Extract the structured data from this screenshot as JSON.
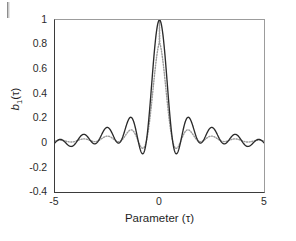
{
  "figure": {
    "axis_labels": {
      "x": "Parameter (τ)",
      "y": "b₁(τ)",
      "y_main": "b",
      "y_sub": "1",
      "y_tail": "(τ)"
    },
    "xticks": [
      "-5",
      "0",
      "5"
    ],
    "yticks": [
      "1",
      "0.8",
      "0.6",
      "0.4",
      "0.2",
      "0",
      "-0.2",
      "-0.4"
    ],
    "colors": {
      "solid_curve": "#2b2b2b",
      "dotted_curve": "#9a9a9a",
      "axis": "#3b3b3b",
      "background": "#ffffff"
    }
  },
  "chart_data": {
    "type": "line",
    "title": "",
    "subtitle": "",
    "xlabel": "Parameter (τ)",
    "ylabel": "b₁(τ)",
    "xlim": [
      -5,
      5
    ],
    "ylim": [
      -0.4,
      1
    ],
    "xticks": [
      -5,
      0,
      5
    ],
    "yticks": [
      -0.4,
      -0.2,
      0,
      0.2,
      0.4,
      0.6,
      0.8,
      1
    ],
    "grid": false,
    "legend": null,
    "annotations": [],
    "series": [
      {
        "name": "solid",
        "style": "solid",
        "color": "#2b2b2b",
        "x": [
          -5,
          -4.8,
          -4.6,
          -4.4,
          -4.2,
          -4,
          -3.8,
          -3.6,
          -3.4,
          -3.2,
          -3,
          -2.8,
          -2.6,
          -2.4,
          -2.2,
          -2,
          -1.8,
          -1.6,
          -1.4,
          -1.2,
          -1,
          -0.8,
          -0.6,
          -0.4,
          -0.2,
          0,
          0.2,
          0.4,
          0.6,
          0.8,
          1,
          1.2,
          1.4,
          1.6,
          1.8,
          2,
          2.2,
          2.4,
          2.6,
          2.8,
          3,
          3.2,
          3.4,
          3.6,
          3.8,
          4,
          4.2,
          4.4,
          4.6,
          4.8,
          5
        ],
        "y": [
          -0.101,
          -0.072,
          -0.042,
          -0.015,
          0.005,
          0.017,
          0.018,
          0.009,
          -0.01,
          -0.037,
          -0.07,
          -0.104,
          -0.136,
          -0.159,
          -0.168,
          -0.158,
          -0.125,
          -0.067,
          0.014,
          0.052,
          0.043,
          0.005,
          -0.055,
          -0.128,
          -0.2,
          -0.262,
          -0.297,
          -0.295,
          -0.248,
          -0.155,
          -0.021,
          0.139,
          0.31,
          0.475,
          0.62,
          0.74,
          0.844,
          0.93,
          0.981,
          1.0,
          0.981,
          0.93,
          0.844,
          0.74,
          0.62,
          0.475,
          0.31,
          0.139,
          -0.021,
          -0.155,
          -0.248
        ],
        "note": "plotted y sampled left-to-right over full domain"
      },
      {
        "name": "dotted",
        "style": "dotted",
        "color": "#9a9a9a",
        "x": [
          -5,
          -4.5,
          -4,
          -3.5,
          -3,
          -2.5,
          -2,
          -1.5,
          -1,
          -0.5,
          0,
          0.5,
          1,
          1.5,
          2,
          2.5,
          3,
          3.5,
          4,
          4.5,
          5
        ],
        "y": [
          -0.04,
          0.04,
          0.06,
          0.0,
          -0.1,
          -0.14,
          -0.06,
          0.09,
          0.1,
          -0.05,
          -0.22,
          0.1,
          1.0,
          0.1,
          -0.22,
          -0.05,
          0.1,
          0.09,
          -0.06,
          -0.14,
          -0.1
        ],
        "note": "higher sidelobes than solid curve"
      }
    ]
  }
}
